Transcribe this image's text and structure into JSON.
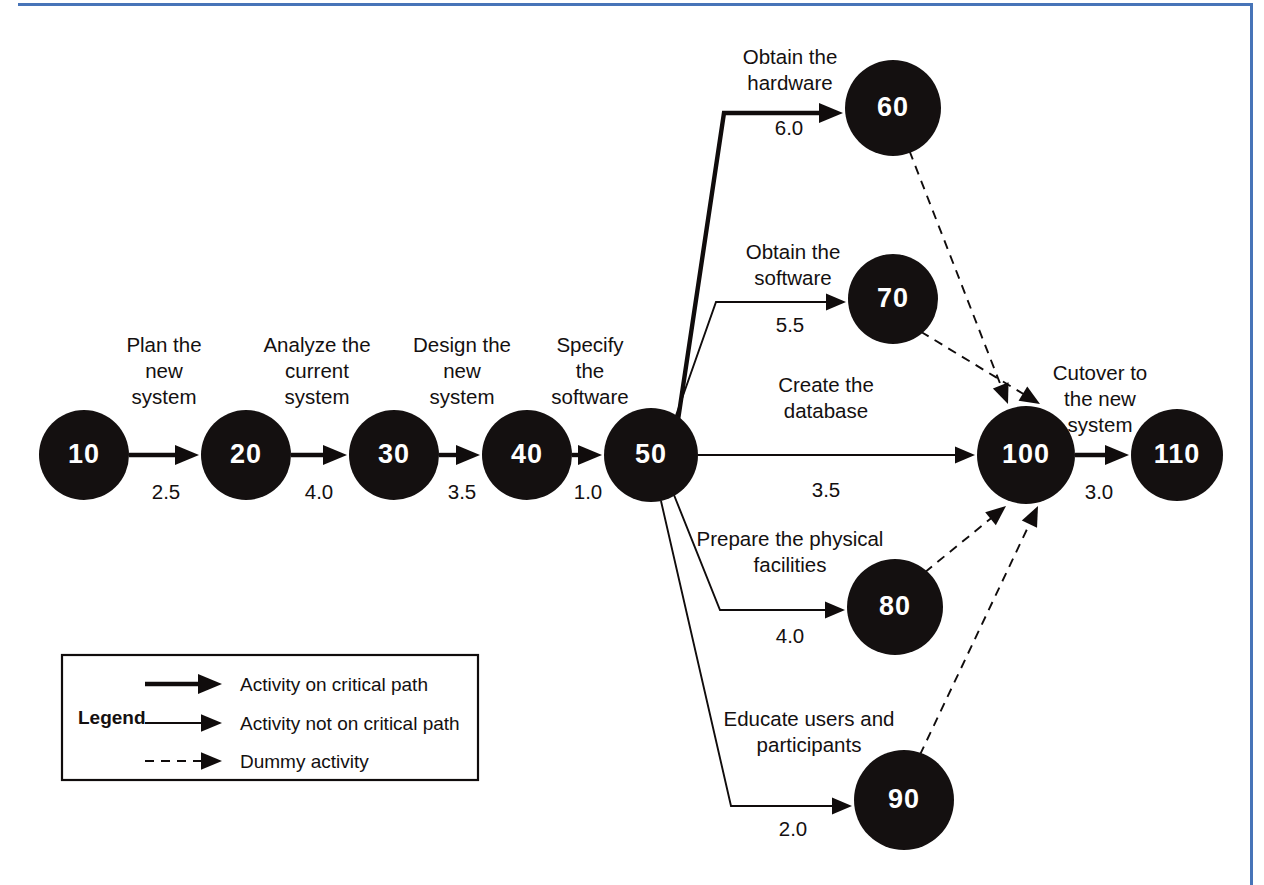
{
  "diagram": {
    "type": "pert-network",
    "colors": {
      "node_fill": "#141010",
      "node_text": "#ffffff",
      "line": "#100c0c",
      "accent_rule": "#4774b8",
      "background": "#ffffff"
    },
    "nodes": [
      {
        "id": "10",
        "label": "10",
        "cx": 84,
        "cy": 455,
        "r": 45
      },
      {
        "id": "20",
        "label": "20",
        "cx": 246,
        "cy": 455,
        "r": 45
      },
      {
        "id": "30",
        "label": "30",
        "cx": 394,
        "cy": 455,
        "r": 45
      },
      {
        "id": "40",
        "label": "40",
        "cx": 527,
        "cy": 455,
        "r": 45
      },
      {
        "id": "50",
        "label": "50",
        "cx": 651,
        "cy": 455,
        "r": 47
      },
      {
        "id": "60",
        "label": "60",
        "cx": 893,
        "cy": 108,
        "r": 48
      },
      {
        "id": "70",
        "label": "70",
        "cx": 893,
        "cy": 299,
        "r": 45
      },
      {
        "id": "80",
        "label": "80",
        "cx": 895,
        "cy": 607,
        "r": 48
      },
      {
        "id": "90",
        "label": "90",
        "cx": 904,
        "cy": 800,
        "r": 50
      },
      {
        "id": "100",
        "label": "100",
        "cx": 1026,
        "cy": 455,
        "r": 49
      },
      {
        "id": "110",
        "label": "110",
        "cx": 1177,
        "cy": 455,
        "r": 46
      }
    ],
    "activities": [
      {
        "from": "10",
        "to": "20",
        "name": "Plan the\nnew\nsystem",
        "duration": "2.5",
        "critical": true,
        "dummy": false
      },
      {
        "from": "20",
        "to": "30",
        "name": "Analyze the\ncurrent\nsystem",
        "duration": "4.0",
        "critical": true,
        "dummy": false
      },
      {
        "from": "30",
        "to": "40",
        "name": "Design the\nnew\nsystem",
        "duration": "3.5",
        "critical": true,
        "dummy": false
      },
      {
        "from": "40",
        "to": "50",
        "name": "Specify\nthe\nsoftware",
        "duration": "1.0",
        "critical": true,
        "dummy": false
      },
      {
        "from": "50",
        "to": "60",
        "name": "Obtain the\nhardware",
        "duration": "6.0",
        "critical": true,
        "dummy": false
      },
      {
        "from": "50",
        "to": "70",
        "name": "Obtain the\nsoftware",
        "duration": "5.5",
        "critical": false,
        "dummy": false
      },
      {
        "from": "50",
        "to": "100",
        "name": "Create the\ndatabase",
        "duration": "3.5",
        "critical": false,
        "dummy": false
      },
      {
        "from": "50",
        "to": "80",
        "name": "Prepare the physical\nfacilities",
        "duration": "4.0",
        "critical": false,
        "dummy": false
      },
      {
        "from": "50",
        "to": "90",
        "name": "Educate users and\nparticipants",
        "duration": "2.0",
        "critical": false,
        "dummy": false
      },
      {
        "from": "60",
        "to": "100",
        "name": "",
        "duration": "",
        "critical": false,
        "dummy": true
      },
      {
        "from": "70",
        "to": "100",
        "name": "",
        "duration": "",
        "critical": false,
        "dummy": true
      },
      {
        "from": "80",
        "to": "100",
        "name": "",
        "duration": "",
        "critical": false,
        "dummy": true
      },
      {
        "from": "90",
        "to": "100",
        "name": "",
        "duration": "",
        "critical": false,
        "dummy": true
      },
      {
        "from": "100",
        "to": "110",
        "name": "Cutover to\nthe new\nsystem",
        "duration": "3.0",
        "critical": true,
        "dummy": false
      }
    ],
    "activity_labels": [
      {
        "id": "a10-20",
        "lines": [
          "Plan the",
          "new",
          "system"
        ],
        "x": 164,
        "y": 352,
        "duration": "2.5",
        "dur_x": 166,
        "dur_y": 499
      },
      {
        "id": "a20-30",
        "lines": [
          "Analyze the",
          "current",
          "system"
        ],
        "x": 317,
        "y": 352,
        "duration": "4.0",
        "dur_x": 319,
        "dur_y": 499
      },
      {
        "id": "a30-40",
        "lines": [
          "Design the",
          "new",
          "system"
        ],
        "x": 462,
        "y": 352,
        "duration": "3.5",
        "dur_x": 462,
        "dur_y": 499
      },
      {
        "id": "a40-50",
        "lines": [
          "Specify",
          "the",
          "software"
        ],
        "x": 590,
        "y": 352,
        "duration": "1.0",
        "dur_x": 588,
        "dur_y": 499
      },
      {
        "id": "a50-60",
        "lines": [
          "Obtain the",
          "hardware"
        ],
        "x": 790,
        "y": 64,
        "duration": "6.0",
        "dur_x": 789,
        "dur_y": 135
      },
      {
        "id": "a50-70",
        "lines": [
          "Obtain the",
          "software"
        ],
        "x": 793,
        "y": 259,
        "duration": "5.5",
        "dur_x": 790,
        "dur_y": 332
      },
      {
        "id": "a50-100",
        "lines": [
          "Create the",
          "database"
        ],
        "x": 826,
        "y": 392,
        "duration": "3.5",
        "dur_x": 826,
        "dur_y": 497
      },
      {
        "id": "a50-80",
        "lines": [
          "Prepare the physical",
          "facilities"
        ],
        "x": 790,
        "y": 546,
        "duration": "4.0",
        "dur_x": 790,
        "dur_y": 643
      },
      {
        "id": "a50-90",
        "lines": [
          "Educate users and",
          "participants"
        ],
        "x": 809,
        "y": 726,
        "duration": "2.0",
        "dur_x": 793,
        "dur_y": 836
      },
      {
        "id": "a100-110",
        "lines": [
          "Cutover to",
          "the new",
          "system"
        ],
        "x": 1100,
        "y": 380,
        "duration": "3.0",
        "dur_x": 1099,
        "dur_y": 499
      }
    ],
    "legend": {
      "title": "Legend",
      "box": {
        "x": 62,
        "y": 655,
        "w": 416,
        "h": 125
      },
      "title_x": 78,
      "title_y": 724,
      "items": [
        {
          "style": "critical",
          "label": "Activity on critical path",
          "y": 684
        },
        {
          "style": "normal",
          "label": "Activity not on critical path",
          "y": 723
        },
        {
          "style": "dummy",
          "label": "Dummy activity",
          "y": 761
        }
      ],
      "line_x1": 145,
      "line_x2": 222,
      "text_x": 240
    }
  }
}
